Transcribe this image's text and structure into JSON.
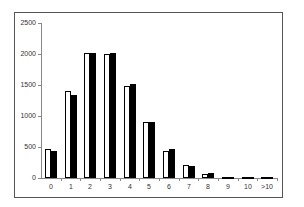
{
  "chart_data": {
    "type": "bar",
    "title": "",
    "xlabel": "",
    "ylabel": "",
    "categories": [
      "0",
      "1",
      "2",
      "3",
      "4",
      "5",
      "6",
      "7",
      "8",
      "9",
      "10",
      ">10"
    ],
    "series": [
      {
        "name": "Series 1 (white)",
        "color": "#ffffff",
        "values": [
          460,
          1400,
          2020,
          2000,
          1480,
          910,
          430,
          210,
          70,
          10,
          3,
          2
        ]
      },
      {
        "name": "Series 2 (black)",
        "color": "#000000",
        "values": [
          440,
          1340,
          2020,
          2020,
          1510,
          900,
          460,
          190,
          80,
          20,
          5,
          3
        ]
      }
    ],
    "ylim": [
      0,
      2500
    ],
    "yticks": [
      0,
      500,
      1000,
      1500,
      2000,
      2500
    ],
    "grid": false,
    "legend": "none"
  }
}
